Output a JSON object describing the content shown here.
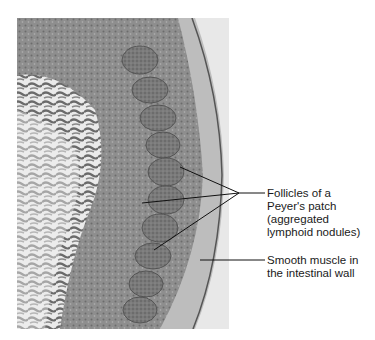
{
  "figure": {
    "colors": {
      "background": "#ffffff",
      "tissue_dark": "#555555",
      "tissue_mid": "#8a8a8a",
      "tissue_light": "#c8c8c8",
      "lumen": "#e9e9e9",
      "leader_line": "#111111"
    }
  },
  "labels": {
    "follicles": "Follicles of a\nPeyer's patch\n(aggregated\nlymphoid nodules)",
    "smooth_muscle": "Smooth muscle in\nthe intestinal wall"
  }
}
